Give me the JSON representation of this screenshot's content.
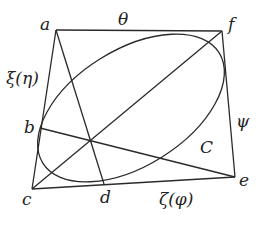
{
  "diagram": {
    "type": "geometry",
    "stroke_color": "#2a2a2a",
    "points": {
      "a": {
        "label": "a",
        "x": 56,
        "y": 30
      },
      "f": {
        "label": "f",
        "x": 222,
        "y": 31
      },
      "b": {
        "label": "b",
        "x": 40,
        "y": 128
      },
      "c": {
        "label": "c",
        "x": 32,
        "y": 189
      },
      "d": {
        "label": "d",
        "x": 104,
        "y": 184
      },
      "e": {
        "label": "e",
        "x": 235,
        "y": 177
      }
    },
    "edge_labels": {
      "top": "θ",
      "left": "ξ(η)",
      "right": "ψ",
      "bottom": "ζ(φ)"
    },
    "curve_label": "C",
    "ellipse": {
      "cx": 131,
      "cy": 108,
      "rx": 104,
      "ry": 62,
      "rotation": -35
    }
  }
}
